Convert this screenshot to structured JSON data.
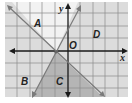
{
  "diagram": {
    "type": "coordinate-plane-inequality-regions",
    "axes": {
      "x_label": "x",
      "y_label": "y",
      "origin_label": "O"
    },
    "grid": {
      "cols": 10,
      "rows": 8,
      "spacing_px": 12.5
    },
    "lines": [
      {
        "name": "decreasing-line",
        "from": [
          8,
          6
        ],
        "to": [
          104,
          96
        ]
      },
      {
        "name": "increasing-line",
        "from": [
          33,
          96
        ],
        "to": [
          80,
          7
        ]
      }
    ],
    "intersection_px": [
      56,
      52
    ],
    "regions": [
      {
        "label": "A",
        "x": 34,
        "y": 27,
        "shade": "#d9d9d9"
      },
      {
        "label": "B",
        "x": 21,
        "y": 85,
        "shade": "#d9d9d9"
      },
      {
        "label": "C",
        "x": 56,
        "y": 85,
        "shade": "#b8b8b8"
      },
      {
        "label": "D",
        "x": 93,
        "y": 38,
        "shade": "#d9d9d9"
      }
    ],
    "colors": {
      "grid": "#8a8a8a",
      "axis": "#1a1a1a",
      "line": "#7a7a7a",
      "light_shade": "#dcdcdc",
      "dark_shade": "#b5b5b5",
      "top_region": "#f2f2f2"
    }
  }
}
